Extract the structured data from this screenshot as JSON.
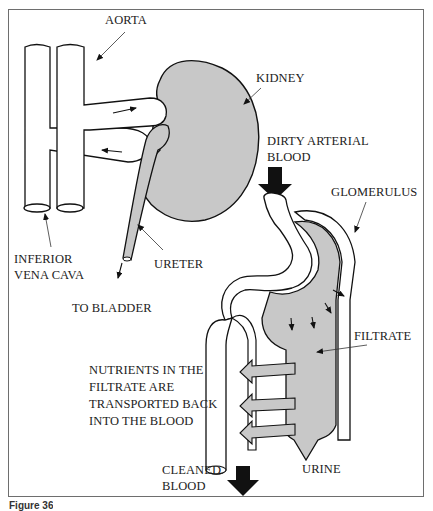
{
  "figure": {
    "caption": "Figure 36",
    "colors": {
      "outline": "#111111",
      "tissue_fill": "#c8c8c8",
      "arrow_fill": "#111111",
      "frame": "#6e6e6e"
    }
  },
  "labels": {
    "aorta": "AORTA",
    "kidney": "KIDNEY",
    "inferior_vena_cava": "INFERIOR\nVENA CAVA",
    "ureter": "URETER",
    "to_bladder": "TO BLADDER",
    "dirty_arterial_blood": "DIRTY ARTERIAL\nBLOOD",
    "glomerulus": "GLOMERULUS",
    "filtrate": "FILTRATE",
    "nutrients": "NUTRIENTS IN THE\nFILTRATE ARE\nTRANSPORTED BACK\nINTO THE BLOOD",
    "cleaned_blood": "CLEANED\nBLOOD",
    "urine": "URINE"
  }
}
